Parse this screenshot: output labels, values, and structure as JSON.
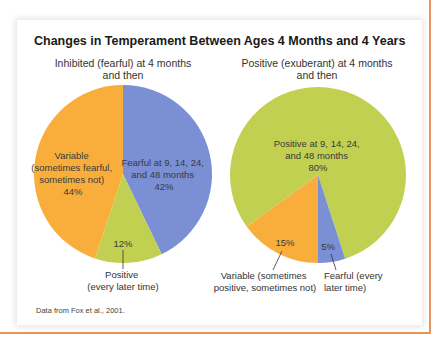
{
  "figure": {
    "title": "Changes in Temperament Between Ages 4 Months and 4 Years",
    "source": "Data from Fox et al., 2001."
  },
  "colors": {
    "fearful": "#7B8FD4",
    "variable": "#F9AE3C",
    "positive": "#C1D051",
    "frame": "#E8955A"
  },
  "chart_data": [
    {
      "type": "pie",
      "title": "Inhibited (fearful) at 4 months and then",
      "title_lines": [
        "Inhibited (fearful) at 4 months",
        "and then"
      ],
      "slices": [
        {
          "label": "Fearful at 9, 14, 24, and 48 months",
          "value": 42,
          "color": "#7B8FD4"
        },
        {
          "label": "Positive (every later time)",
          "value": 12,
          "color": "#C1D051"
        },
        {
          "label": "Variable (sometimes fearful, sometimes not)",
          "value": 44,
          "color": "#F9AE3C"
        }
      ],
      "labels": {
        "fearful": [
          "Fearful at 9, 14, 24,",
          "and 48 months",
          "42%"
        ],
        "variable": [
          "Variable",
          "(sometimes fearful,",
          "sometimes not)",
          "44%"
        ],
        "positive_pct": "12%",
        "positive_callout": [
          "Positive",
          "(every later time)"
        ]
      }
    },
    {
      "type": "pie",
      "title": "Positive (exuberant) at 4 months and then",
      "title_lines": [
        "Positive (exuberant) at 4 months",
        "and then"
      ],
      "slices": [
        {
          "label": "Positive at 9, 14, 24, and 48 months",
          "value": 80,
          "color": "#C1D051"
        },
        {
          "label": "Fearful (every later time)",
          "value": 5,
          "color": "#7B8FD4"
        },
        {
          "label": "Variable (sometimes positive, sometimes not)",
          "value": 15,
          "color": "#F9AE3C"
        }
      ],
      "labels": {
        "positive": [
          "Positive at 9, 14, 24,",
          "and 48 months",
          "80%"
        ],
        "variable_pct": "15%",
        "fearful_pct": "5%",
        "variable_callout": [
          "Variable (sometimes",
          "positive, sometimes not)"
        ],
        "fearful_callout": [
          "Fearful (every",
          "later time)"
        ]
      }
    }
  ]
}
